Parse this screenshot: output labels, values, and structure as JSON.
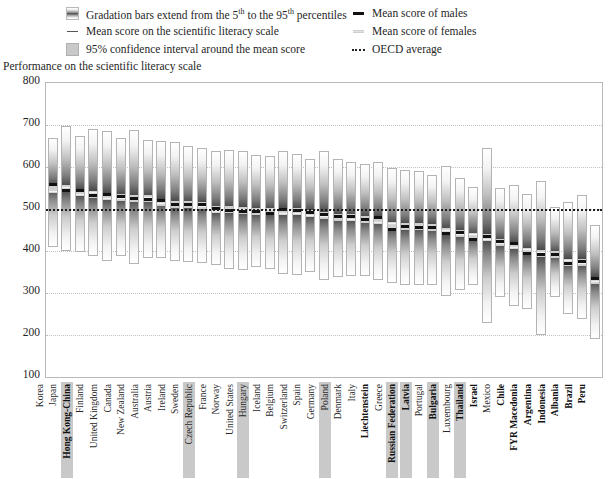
{
  "legend": {
    "left": [
      {
        "icon": "gradation-bar-swatch",
        "text_pre": "Gradation bars extend from the 5",
        "sup1": "th",
        "text_mid": " to the 95",
        "sup2": "th",
        "text_post": " percentiles",
        "full": "Gradation bars extend from the 5th to the 95th percentiles"
      },
      {
        "icon": "mean-line-swatch",
        "full": "Mean score on the scientific literacy scale"
      },
      {
        "icon": "confidence-interval-swatch",
        "full": "95% confidence interval around the mean score"
      }
    ],
    "right": [
      {
        "icon": "male-mean-swatch",
        "full": "Mean score of males"
      },
      {
        "icon": "female-mean-swatch",
        "full": "Mean score of females"
      },
      {
        "icon": "oecd-average-swatch",
        "full": "OECD average"
      }
    ]
  },
  "axis_title": "Performance on the scientific literacy scale",
  "chart_data": {
    "type": "bar",
    "title": "Performance on the scientific literacy scale",
    "subtitle": "",
    "xlabel": "",
    "ylabel": "Performance on the scientific literacy scale",
    "ylim": [
      100,
      800
    ],
    "yticks": [
      800,
      700,
      600,
      500,
      400,
      300,
      200,
      100
    ],
    "grid": true,
    "legend_position": "top",
    "oecd_average": 500,
    "annotations": [
      "Gradation bars extend from the 5th to the 95th percentiles"
    ],
    "series": [
      {
        "name": "p5"
      },
      {
        "name": "p95"
      },
      {
        "name": "mean"
      },
      {
        "name": "mean_males"
      },
      {
        "name": "mean_females"
      }
    ],
    "categories": [
      "Korea",
      "Japan",
      "Hong Kong-China",
      "Finland",
      "United Kingdom",
      "Canada",
      "New Zealand",
      "Australia",
      "Austria",
      "Ireland",
      "Sweden",
      "Czech Republic",
      "France",
      "Norway",
      "United States",
      "Hungary",
      "Iceland",
      "Belgium",
      "Switzerland",
      "Spain",
      "Germany",
      "Poland",
      "Denmark",
      "Italy",
      "Liechtenstein",
      "Greece",
      "Russian Federation",
      "Latvia",
      "Portugal",
      "Bulgaria",
      "Luxembourg",
      "Thailand",
      "Israel",
      "Mexico",
      "Chile",
      "FYR Macedonia",
      "Argentina",
      "Indonesia",
      "Albania",
      "Brazil",
      "Peru"
    ],
    "rows": [
      {
        "country": "Korea",
        "p5": 409,
        "p95": 668,
        "mean": 552,
        "males": 561,
        "females": 544,
        "oecd": true,
        "highlight": false,
        "bold": false
      },
      {
        "country": "Japan",
        "p5": 400,
        "p95": 698,
        "mean": 550,
        "males": 547,
        "females": 554,
        "oecd": true,
        "highlight": false,
        "bold": false
      },
      {
        "country": "Hong Kong-China",
        "p5": 398,
        "p95": 673,
        "mean": 541,
        "males": 546,
        "females": 536,
        "oecd": false,
        "highlight": true,
        "bold": true
      },
      {
        "country": "Finland",
        "p5": 388,
        "p95": 690,
        "mean": 538,
        "males": 534,
        "females": 541,
        "oecd": true,
        "highlight": false,
        "bold": false
      },
      {
        "country": "United Kingdom",
        "p5": 376,
        "p95": 686,
        "mean": 532,
        "males": 537,
        "females": 528,
        "oecd": true,
        "highlight": false,
        "bold": false
      },
      {
        "country": "Canada",
        "p5": 387,
        "p95": 668,
        "mean": 529,
        "males": 531,
        "females": 527,
        "oecd": true,
        "highlight": false,
        "bold": false
      },
      {
        "country": "New Zealand",
        "p5": 370,
        "p95": 688,
        "mean": 528,
        "males": 528,
        "females": 528,
        "oecd": true,
        "highlight": false,
        "bold": false
      },
      {
        "country": "Australia",
        "p5": 384,
        "p95": 665,
        "mean": 528,
        "males": 526,
        "females": 529,
        "oecd": true,
        "highlight": false,
        "bold": false
      },
      {
        "country": "Austria",
        "p5": 383,
        "p95": 662,
        "mean": 519,
        "males": 523,
        "females": 515,
        "oecd": true,
        "highlight": false,
        "bold": false
      },
      {
        "country": "Ireland",
        "p5": 375,
        "p95": 660,
        "mean": 513,
        "males": 513,
        "females": 513,
        "oecd": true,
        "highlight": false,
        "bold": false
      },
      {
        "country": "Sweden",
        "p5": 375,
        "p95": 650,
        "mean": 512,
        "males": 512,
        "females": 512,
        "oecd": true,
        "highlight": false,
        "bold": false
      },
      {
        "country": "Czech Republic",
        "p5": 372,
        "p95": 645,
        "mean": 511,
        "males": 513,
        "females": 509,
        "oecd": true,
        "highlight": true,
        "bold": false
      },
      {
        "country": "France",
        "p5": 367,
        "p95": 639,
        "mean": 500,
        "males": 504,
        "females": 497,
        "oecd": true,
        "highlight": false,
        "bold": false
      },
      {
        "country": "Norway",
        "p5": 357,
        "p95": 640,
        "mean": 500,
        "males": 499,
        "females": 501,
        "oecd": true,
        "highlight": false,
        "bold": false
      },
      {
        "country": "United States",
        "p5": 354,
        "p95": 638,
        "mean": 499,
        "males": 497,
        "females": 502,
        "oecd": true,
        "highlight": false,
        "bold": false
      },
      {
        "country": "Hungary",
        "p5": 362,
        "p95": 629,
        "mean": 496,
        "males": 496,
        "females": 496,
        "oecd": true,
        "highlight": true,
        "bold": false
      },
      {
        "country": "Iceland",
        "p5": 358,
        "p95": 627,
        "mean": 496,
        "males": 491,
        "females": 500,
        "oecd": true,
        "highlight": false,
        "bold": false
      },
      {
        "country": "Belgium",
        "p5": 346,
        "p95": 638,
        "mean": 496,
        "males": 500,
        "females": 492,
        "oecd": true,
        "highlight": false,
        "bold": false
      },
      {
        "country": "Switzerland",
        "p5": 344,
        "p95": 630,
        "mean": 496,
        "males": 499,
        "females": 492,
        "oecd": true,
        "highlight": false,
        "bold": false
      },
      {
        "country": "Spain",
        "p5": 350,
        "p95": 619,
        "mean": 491,
        "males": 493,
        "females": 488,
        "oecd": true,
        "highlight": false,
        "bold": false
      },
      {
        "country": "Germany",
        "p5": 330,
        "p95": 638,
        "mean": 487,
        "males": 489,
        "females": 485,
        "oecd": true,
        "highlight": false,
        "bold": false
      },
      {
        "country": "Poland",
        "p5": 339,
        "p95": 619,
        "mean": 483,
        "males": 484,
        "females": 482,
        "oecd": true,
        "highlight": true,
        "bold": false
      },
      {
        "country": "Denmark",
        "p5": 340,
        "p95": 612,
        "mean": 481,
        "males": 484,
        "females": 478,
        "oecd": true,
        "highlight": false,
        "bold": false
      },
      {
        "country": "Italy",
        "p5": 340,
        "p95": 608,
        "mean": 478,
        "males": 478,
        "females": 478,
        "oecd": true,
        "highlight": false,
        "bold": false
      },
      {
        "country": "Liechtenstein",
        "p5": 330,
        "p95": 612,
        "mean": 476,
        "males": 481,
        "females": 470,
        "oecd": false,
        "highlight": false,
        "bold": true
      },
      {
        "country": "Greece",
        "p5": 324,
        "p95": 598,
        "mean": 461,
        "males": 454,
        "females": 467,
        "oecd": true,
        "highlight": false,
        "bold": false
      },
      {
        "country": "Russian Federation",
        "p5": 320,
        "p95": 592,
        "mean": 460,
        "males": 461,
        "females": 459,
        "oecd": false,
        "highlight": true,
        "bold": true
      },
      {
        "country": "Latvia",
        "p5": 318,
        "p95": 590,
        "mean": 460,
        "males": 459,
        "females": 460,
        "oecd": false,
        "highlight": true,
        "bold": true
      },
      {
        "country": "Portugal",
        "p5": 320,
        "p95": 580,
        "mean": 459,
        "males": 459,
        "females": 459,
        "oecd": true,
        "highlight": false,
        "bold": false
      },
      {
        "country": "Bulgaria",
        "p5": 294,
        "p95": 603,
        "mean": 448,
        "males": 444,
        "females": 452,
        "oecd": false,
        "highlight": true,
        "bold": true
      },
      {
        "country": "Luxembourg",
        "p5": 307,
        "p95": 573,
        "mean": 443,
        "males": 446,
        "females": 441,
        "oecd": true,
        "highlight": false,
        "bold": false
      },
      {
        "country": "Thailand",
        "p5": 320,
        "p95": 552,
        "mean": 436,
        "males": 430,
        "females": 441,
        "oecd": false,
        "highlight": true,
        "bold": true
      },
      {
        "country": "Israel",
        "p5": 228,
        "p95": 645,
        "mean": 434,
        "males": 438,
        "females": 430,
        "oecd": false,
        "highlight": false,
        "bold": true
      },
      {
        "country": "Mexico",
        "p5": 290,
        "p95": 551,
        "mean": 422,
        "males": 424,
        "females": 420,
        "oecd": true,
        "highlight": false,
        "bold": false
      },
      {
        "country": "Chile",
        "p5": 270,
        "p95": 558,
        "mean": 415,
        "males": 420,
        "females": 411,
        "oecd": false,
        "highlight": false,
        "bold": true
      },
      {
        "country": "FYR Macedonia",
        "p5": 262,
        "p95": 536,
        "mean": 401,
        "males": 396,
        "females": 406,
        "oecd": false,
        "highlight": false,
        "bold": true
      },
      {
        "country": "Argentina",
        "p5": 200,
        "p95": 567,
        "mean": 396,
        "males": 394,
        "females": 398,
        "oecd": false,
        "highlight": false,
        "bold": true
      },
      {
        "country": "Indonesia",
        "p5": 290,
        "p95": 505,
        "mean": 393,
        "males": 394,
        "females": 392,
        "oecd": false,
        "highlight": false,
        "bold": true
      },
      {
        "country": "Albania",
        "p5": 250,
        "p95": 516,
        "mean": 376,
        "males": 372,
        "females": 380,
        "oecd": false,
        "highlight": false,
        "bold": true
      },
      {
        "country": "Brazil",
        "p5": 239,
        "p95": 533,
        "mean": 375,
        "males": 378,
        "females": 372,
        "oecd": false,
        "highlight": false,
        "bold": true
      },
      {
        "country": "Peru",
        "p5": 190,
        "p95": 462,
        "mean": 333,
        "males": 337,
        "females": 330,
        "oecd": false,
        "highlight": false,
        "bold": true
      }
    ]
  }
}
